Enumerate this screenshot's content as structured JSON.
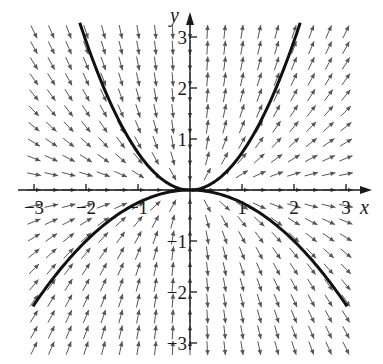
{
  "chart_data": {
    "type": "direction_field",
    "title": "",
    "equation_inferred": "dy/dx = 2y/x",
    "xlabel": "x",
    "ylabel": "y",
    "xlim": [
      -3.2,
      3.5
    ],
    "ylim": [
      -3.2,
      3.4
    ],
    "x_ticks": [
      -3,
      -2,
      -1,
      1,
      2,
      3
    ],
    "y_ticks": [
      -3,
      -2,
      -1,
      1,
      2,
      3
    ],
    "x_tick_labels": [
      "−3",
      "−2",
      "−1",
      "1",
      "2",
      "3"
    ],
    "y_tick_labels": [
      "−3",
      "−2",
      "−1",
      "1",
      "2",
      "3"
    ],
    "grid": false,
    "legend": null,
    "field_grid": {
      "x_min": -3,
      "x_max": 3,
      "x_step": 0.3333,
      "y_min": -3.1,
      "y_max": 3.1,
      "y_step": 0.31
    },
    "solution_curves": [
      {
        "name": "upper",
        "formula": "y = 0.73 x^2",
        "C": 0.73,
        "x_range": [
          -2.12,
          2.12
        ]
      },
      {
        "name": "lower",
        "formula": "y = -0.25 x^2",
        "C": -0.25,
        "x_range": [
          -3.02,
          3.02
        ]
      }
    ],
    "colors": {
      "arrows": "#555555",
      "curves": "#111111",
      "axes": "#1a1a1a"
    }
  },
  "axes": {
    "x_label": "x",
    "y_label": "y"
  },
  "layout": {
    "origin_px": [
      190,
      190
    ],
    "unit_x_px": 52,
    "unit_y_px": 51
  }
}
